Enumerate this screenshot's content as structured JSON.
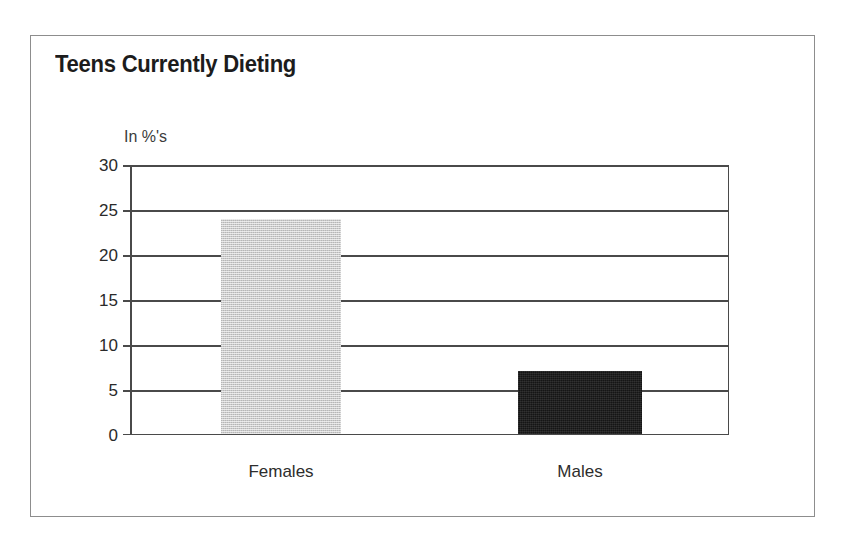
{
  "chart_data": {
    "type": "bar",
    "title": "Teens Currently Dieting",
    "subtitle": "",
    "xlabel": "",
    "ylabel": "In %'s",
    "categories": [
      "Females",
      "Males"
    ],
    "values": [
      24,
      7
    ],
    "series": [
      {
        "name": "Percent currently dieting",
        "values": [
          24,
          7
        ]
      }
    ],
    "ylim": [
      0,
      30
    ],
    "yticks": [
      0,
      5,
      10,
      15,
      20,
      25,
      30
    ],
    "ytick_labels": [
      "0",
      "5",
      "10",
      "15",
      "20",
      "25",
      "30"
    ],
    "grid": true,
    "grid_axis": "y",
    "legend": false,
    "legend_position": "none",
    "bar_colors": [
      "#cbcbcb",
      "#151515"
    ],
    "axis_color": "#4a4a4a",
    "frame_color": "#8d8d8d",
    "title_color": "#1c1c1c",
    "annotations": []
  },
  "chart": {
    "title": "Teens Currently Dieting",
    "unit_label": "In %'s",
    "y_axis": {
      "ticks": [
        {
          "label": "30",
          "value": 30
        },
        {
          "label": "25",
          "value": 25
        },
        {
          "label": "20",
          "value": 20
        },
        {
          "label": "15",
          "value": 15
        },
        {
          "label": "10",
          "value": 10
        },
        {
          "label": "5",
          "value": 5
        },
        {
          "label": "0",
          "value": 0
        }
      ]
    },
    "bars": [
      {
        "label": "Females",
        "value": 24,
        "style": "gray"
      },
      {
        "label": "Males",
        "value": 7,
        "style": "black"
      }
    ]
  }
}
